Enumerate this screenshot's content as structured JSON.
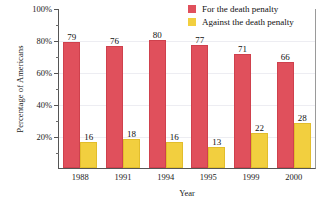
{
  "chart_data": {
    "type": "bar",
    "title": "",
    "xlabel": "Year",
    "ylabel": "Percentage of Americans",
    "categories": [
      "1988",
      "1991",
      "1994",
      "1995",
      "1999",
      "2000"
    ],
    "series": [
      {
        "name": "For the death penalty",
        "color": "#e0505c",
        "values": [
          79,
          76,
          80,
          77,
          71,
          66
        ]
      },
      {
        "name": "Against the death penalty",
        "color": "#f2cf3f",
        "values": [
          16,
          18,
          16,
          13,
          22,
          28
        ]
      }
    ],
    "ylim": [
      0,
      100
    ],
    "ytick_labels": [
      "100%",
      "80%",
      "60%",
      "40%",
      "20%"
    ],
    "ytick_values": [
      100,
      80,
      60,
      40,
      20
    ],
    "yminor_values": [
      90,
      70,
      50,
      30,
      10
    ],
    "grid": true,
    "legend_position": "top-right"
  },
  "legend": {
    "items": [
      {
        "label": "For the death penalty",
        "swatch": "red-swatch-icon"
      },
      {
        "label": "Against the death penalty",
        "swatch": "yellow-swatch-icon"
      }
    ]
  }
}
